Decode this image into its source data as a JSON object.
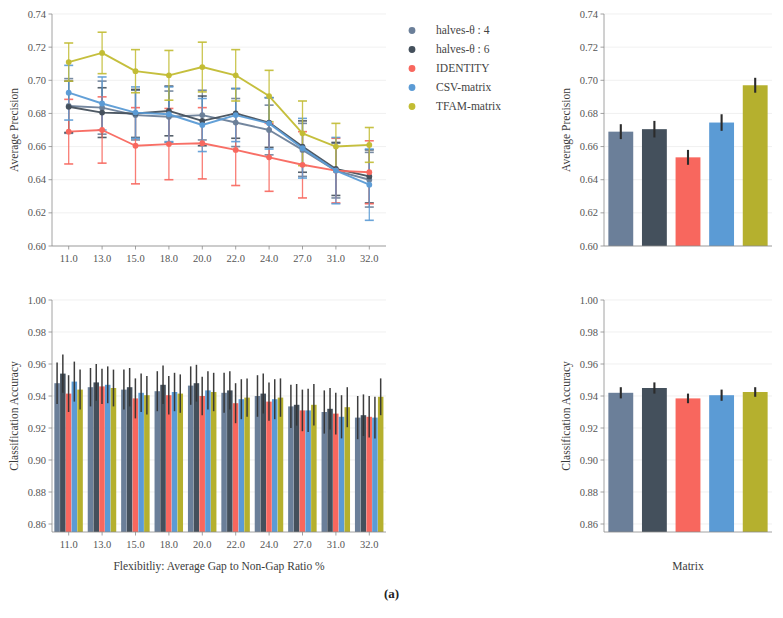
{
  "figure": {
    "caption": "(a)"
  },
  "legend": {
    "items": [
      {
        "label": "halves-θ : 4",
        "color": "#6b7f99",
        "key": "halves4"
      },
      {
        "label": "halves-θ : 6",
        "color": "#44505c",
        "key": "halves6"
      },
      {
        "label": "IDENTITY",
        "color": "#f8675e",
        "key": "identity"
      },
      {
        "label": "CSV-matrix",
        "color": "#5b9bd5",
        "key": "csv"
      },
      {
        "label": "TFAM-matrix",
        "color": "#c2bc33",
        "key": "tfam"
      }
    ]
  },
  "chart_data": [
    {
      "id": "top-left-line",
      "type": "line",
      "title": "",
      "xlabel": "",
      "ylabel": "Average Precision",
      "categories": [
        "11.0",
        "13.0",
        "15.0",
        "18.0",
        "20.0",
        "22.0",
        "24.0",
        "27.0",
        "31.0",
        "32.0"
      ],
      "xticklabels": [
        "11.0",
        "13.0",
        "15.0",
        "18.0",
        "20.0",
        "22.0",
        "24.0",
        "27.0",
        "31.0",
        "32.0"
      ],
      "yticklabels": [
        "0.60",
        "0.62",
        "0.64",
        "0.66",
        "0.68",
        "0.70",
        "0.72",
        "0.74"
      ],
      "ylim": [
        0.6,
        0.74
      ],
      "grid": true,
      "legend_position": "upper-right",
      "series": [
        {
          "name": "halves-θ : 4",
          "color": "#6b7f99",
          "values": [
            0.6845,
            0.6835,
            0.679,
            0.678,
            0.679,
            0.6745,
            0.67,
            0.658,
            0.6455,
            0.64
          ],
          "err": [
            0.0165,
            0.016,
            0.015,
            0.0155,
            0.015,
            0.0145,
            0.015,
            0.016,
            0.0165,
            0.0165
          ]
        },
        {
          "name": "halves-θ : 6",
          "color": "#44505c",
          "values": [
            0.684,
            0.6805,
            0.68,
            0.6815,
            0.6755,
            0.68,
            0.6745,
            0.66,
            0.6465,
            0.642
          ],
          "err": [
            0.0155,
            0.015,
            0.0145,
            0.015,
            0.015,
            0.015,
            0.015,
            0.0155,
            0.016,
            0.016
          ]
        },
        {
          "name": "IDENTITY",
          "color": "#f8675e",
          "values": [
            0.669,
            0.67,
            0.6605,
            0.6615,
            0.662,
            0.658,
            0.6535,
            0.649,
            0.6455,
            0.6445
          ],
          "err": [
            0.0195,
            0.02,
            0.023,
            0.0215,
            0.0215,
            0.0215,
            0.0205,
            0.02,
            0.0195,
            0.019
          ]
        },
        {
          "name": "CSV-matrix",
          "color": "#5b9bd5",
          "values": [
            0.6925,
            0.686,
            0.6805,
            0.6795,
            0.673,
            0.679,
            0.674,
            0.659,
            0.6455,
            0.637
          ],
          "err": [
            0.0165,
            0.016,
            0.0155,
            0.0165,
            0.016,
            0.016,
            0.0155,
            0.018,
            0.02,
            0.0215
          ]
        },
        {
          "name": "TFAM-matrix",
          "color": "#c2bc33",
          "values": [
            0.711,
            0.7165,
            0.7055,
            0.703,
            0.708,
            0.703,
            0.6905,
            0.668,
            0.66,
            0.661
          ],
          "err": [
            0.0115,
            0.0125,
            0.013,
            0.015,
            0.015,
            0.0155,
            0.0155,
            0.0195,
            0.014,
            0.0105
          ]
        }
      ]
    },
    {
      "id": "top-right-bar",
      "type": "bar",
      "title": "",
      "xlabel": "",
      "ylabel": "Average Precision",
      "categories": [
        "halves-θ : 4",
        "halves-θ : 6",
        "IDENTITY",
        "CSV-matrix",
        "TFAM-matrix"
      ],
      "yticklabels": [
        "0.60",
        "0.62",
        "0.64",
        "0.66",
        "0.68",
        "0.70",
        "0.72",
        "0.74"
      ],
      "ylim": [
        0.6,
        0.74
      ],
      "grid": true,
      "values": [
        0.669,
        0.6705,
        0.6535,
        0.6745,
        0.697
      ],
      "err": [
        0.0045,
        0.005,
        0.0045,
        0.005,
        0.0045
      ],
      "colors": [
        "#6b7f99",
        "#44505c",
        "#f8675e",
        "#5b9bd5",
        "#b5b02e"
      ]
    },
    {
      "id": "bottom-left-grouped-bar",
      "type": "bar",
      "title": "",
      "xlabel": "Flexibitliy: Average Gap to Non-Gap Ratio %",
      "ylabel": "Classification Accuracy",
      "categories": [
        "11.0",
        "13.0",
        "15.0",
        "18.0",
        "20.0",
        "22.0",
        "24.0",
        "27.0",
        "31.0",
        "32.0"
      ],
      "yticklabels": [
        "0.86",
        "0.88",
        "0.90",
        "0.92",
        "0.94",
        "0.96",
        "0.98",
        "1.00"
      ],
      "ylim": [
        0.855,
        1.0
      ],
      "grid": true,
      "series": [
        {
          "name": "halves-θ : 4",
          "color": "#6b7f99",
          "values": [
            0.948,
            0.9455,
            0.944,
            0.943,
            0.9465,
            0.942,
            0.94,
            0.9335,
            0.93,
            0.9265
          ],
          "err": [
            0.013,
            0.012,
            0.0125,
            0.0125,
            0.012,
            0.0125,
            0.013,
            0.0135,
            0.0135,
            0.0135
          ]
        },
        {
          "name": "halves-θ : 6",
          "color": "#44505c",
          "values": [
            0.954,
            0.9485,
            0.9455,
            0.947,
            0.948,
            0.9435,
            0.9415,
            0.9345,
            0.932,
            0.928
          ],
          "err": [
            0.012,
            0.0115,
            0.012,
            0.012,
            0.0115,
            0.012,
            0.0125,
            0.013,
            0.013,
            0.013
          ]
        },
        {
          "name": "IDENTITY",
          "color": "#f8675e",
          "values": [
            0.9415,
            0.946,
            0.9385,
            0.9405,
            0.94,
            0.9355,
            0.9365,
            0.931,
            0.929,
            0.927
          ],
          "err": [
            0.0115,
            0.011,
            0.0125,
            0.012,
            0.012,
            0.0125,
            0.012,
            0.013,
            0.013,
            0.013
          ]
        },
        {
          "name": "CSV-matrix",
          "color": "#5b9bd5",
          "values": [
            0.949,
            0.947,
            0.942,
            0.9425,
            0.9435,
            0.938,
            0.938,
            0.931,
            0.927,
            0.9265
          ],
          "err": [
            0.0125,
            0.0115,
            0.012,
            0.012,
            0.012,
            0.0125,
            0.0125,
            0.0135,
            0.0135,
            0.013
          ]
        },
        {
          "name": "TFAM-matrix",
          "color": "#b5b02e",
          "values": [
            0.944,
            0.945,
            0.9405,
            0.9415,
            0.9425,
            0.939,
            0.939,
            0.9345,
            0.933,
            0.9395
          ],
          "err": [
            0.0125,
            0.0115,
            0.012,
            0.012,
            0.012,
            0.012,
            0.012,
            0.013,
            0.0125,
            0.0115
          ]
        }
      ]
    },
    {
      "id": "bottom-right-bar",
      "type": "bar",
      "title": "",
      "xlabel": "Matrix",
      "ylabel": "Classification Accuracy",
      "categories": [
        "halves-θ : 4",
        "halves-θ : 6",
        "IDENTITY",
        "CSV-matrix",
        "TFAM-matrix"
      ],
      "yticklabels": [
        "0.86",
        "0.88",
        "0.90",
        "0.92",
        "0.94",
        "0.96",
        "0.98",
        "1.00"
      ],
      "ylim": [
        0.855,
        1.0
      ],
      "grid": true,
      "values": [
        0.942,
        0.945,
        0.9385,
        0.9405,
        0.9425
      ],
      "err": [
        0.0035,
        0.0035,
        0.003,
        0.0035,
        0.003
      ],
      "colors": [
        "#6b7f99",
        "#44505c",
        "#f8675e",
        "#5b9bd5",
        "#b5b02e"
      ]
    }
  ]
}
